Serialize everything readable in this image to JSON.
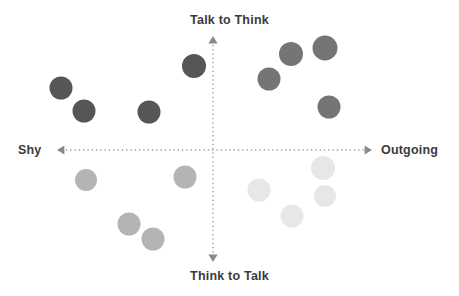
{
  "chart_data": {
    "type": "scatter",
    "title": "",
    "xlabel": "Shy ↔ Outgoing",
    "ylabel": "Think to Talk ↔ Talk to Think",
    "axes": {
      "vertical": {
        "top_label": "Talk to Think",
        "bottom_label": "Think to Talk",
        "x": 213,
        "y_top": 36,
        "y_bottom": 262,
        "style": "dotted",
        "color": "#8a8a8d",
        "arrows": "both"
      },
      "horizontal": {
        "left_label": "Shy",
        "right_label": "Outgoing",
        "y": 150,
        "x_left": 57,
        "x_right": 372,
        "style": "dotted",
        "color": "#8a8a8d",
        "arrows": "both"
      },
      "origin": [
        213,
        150
      ],
      "grid": false,
      "legend": "none"
    },
    "quadrants": [
      {
        "name": "shy-talk-to-think",
        "color": "#565659",
        "points": [
          {
            "x": 61,
            "y": 88,
            "r": 11.5
          },
          {
            "x": 84,
            "y": 111,
            "r": 11.5
          },
          {
            "x": 149,
            "y": 112,
            "r": 11.5
          },
          {
            "x": 194,
            "y": 66,
            "r": 12
          }
        ]
      },
      {
        "name": "outgoing-talk-to-think",
        "color": "#757578",
        "points": [
          {
            "x": 269,
            "y": 79,
            "r": 11.5
          },
          {
            "x": 291,
            "y": 54,
            "r": 12
          },
          {
            "x": 325,
            "y": 48,
            "r": 12.5
          },
          {
            "x": 329,
            "y": 107,
            "r": 11.5
          }
        ]
      },
      {
        "name": "shy-think-to-talk",
        "color": "#b4b4b6",
        "points": [
          {
            "x": 86,
            "y": 180,
            "r": 11
          },
          {
            "x": 185,
            "y": 177,
            "r": 11.5
          },
          {
            "x": 129,
            "y": 224,
            "r": 11.5
          },
          {
            "x": 153,
            "y": 239,
            "r": 11.5
          }
        ]
      },
      {
        "name": "outgoing-think-to-talk",
        "color": "#e7e7e8",
        "points": [
          {
            "x": 323,
            "y": 168,
            "r": 12
          },
          {
            "x": 259,
            "y": 190,
            "r": 11.5
          },
          {
            "x": 325,
            "y": 196,
            "r": 11
          },
          {
            "x": 292,
            "y": 216,
            "r": 11.5
          }
        ]
      }
    ]
  },
  "labels": {
    "top": "Talk to Think",
    "bottom": "Think to Talk",
    "left": "Shy",
    "right": "Outgoing"
  },
  "colors": {
    "axis": "#8a8a8d",
    "text": "#3a3a3c",
    "background": "#ffffff"
  }
}
